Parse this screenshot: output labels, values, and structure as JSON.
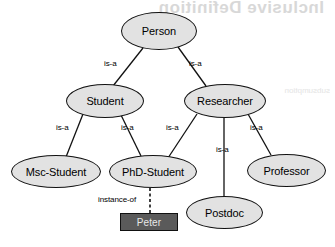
{
  "diagram": {
    "background_color": "#ffffff",
    "node_fill": "#e2e2e2",
    "node_stroke": "#111111",
    "instance_fill": "#5a5a5a",
    "instance_text_color": "#e8e8e8",
    "ghost_text": "Inclusive Definition",
    "ghost_text_secondary": "subsumption",
    "nodes": [
      {
        "id": "person",
        "label": "Person",
        "shape": "ellipse",
        "x": 121,
        "y": 12,
        "w": 76,
        "h": 38
      },
      {
        "id": "student",
        "label": "Student",
        "shape": "ellipse",
        "x": 66,
        "y": 84,
        "w": 78,
        "h": 34
      },
      {
        "id": "researcher",
        "label": "Researcher",
        "shape": "ellipse",
        "x": 184,
        "y": 84,
        "w": 82,
        "h": 34
      },
      {
        "id": "msc",
        "label": "Msc-Student",
        "shape": "ellipse",
        "x": 11,
        "y": 155,
        "w": 90,
        "h": 33
      },
      {
        "id": "phd",
        "label": "PhD-Student",
        "shape": "ellipse",
        "x": 109,
        "y": 155,
        "w": 88,
        "h": 33
      },
      {
        "id": "professor",
        "label": "Professor",
        "shape": "ellipse",
        "x": 247,
        "y": 154,
        "w": 79,
        "h": 33
      },
      {
        "id": "postdoc",
        "label": "Postdoc",
        "shape": "ellipse",
        "x": 186,
        "y": 196,
        "w": 77,
        "h": 33
      },
      {
        "id": "peter",
        "label": "Peter",
        "shape": "box",
        "x": 120,
        "y": 213,
        "w": 58,
        "h": 18
      }
    ],
    "edges": [
      {
        "from": "person",
        "to": "student",
        "label": "is-a",
        "style": "solid",
        "label_x": 104,
        "label_y": 59
      },
      {
        "from": "person",
        "to": "researcher",
        "label": "is-a",
        "style": "solid",
        "label_x": 189,
        "label_y": 59
      },
      {
        "from": "student",
        "to": "msc",
        "label": "is-a",
        "style": "solid",
        "label_x": 56,
        "label_y": 123
      },
      {
        "from": "student",
        "to": "phd",
        "label": "is-a",
        "style": "solid",
        "label_x": 121,
        "label_y": 123
      },
      {
        "from": "researcher",
        "to": "phd",
        "label": "is-a",
        "style": "solid",
        "label_x": 166,
        "label_y": 123
      },
      {
        "from": "researcher",
        "to": "postdoc",
        "label": "is-a",
        "style": "solid",
        "label_x": 216,
        "label_y": 145
      },
      {
        "from": "researcher",
        "to": "professor",
        "label": "is-a",
        "style": "solid",
        "label_x": 250,
        "label_y": 123
      },
      {
        "from": "phd",
        "to": "peter",
        "label": "instance-of",
        "style": "dashed",
        "label_x": 98,
        "label_y": 195
      }
    ],
    "edge_paths": [
      {
        "name": "edge-person-student",
        "x1": 143,
        "y1": 48,
        "x2": 113,
        "y2": 86,
        "style": "solid"
      },
      {
        "name": "edge-person-researcher",
        "x1": 178,
        "y1": 47,
        "x2": 206,
        "y2": 86,
        "style": "solid"
      },
      {
        "name": "edge-student-msc",
        "x1": 83,
        "y1": 114,
        "x2": 66,
        "y2": 157,
        "style": "solid"
      },
      {
        "name": "edge-student-phd",
        "x1": 121,
        "y1": 115,
        "x2": 141,
        "y2": 156,
        "style": "solid"
      },
      {
        "name": "edge-researcher-phd",
        "x1": 197,
        "y1": 114,
        "x2": 168,
        "y2": 158,
        "style": "solid"
      },
      {
        "name": "edge-researcher-postdoc",
        "x1": 224,
        "y1": 118,
        "x2": 224,
        "y2": 197,
        "style": "solid"
      },
      {
        "name": "edge-researcher-prof",
        "x1": 248,
        "y1": 114,
        "x2": 271,
        "y2": 155,
        "style": "solid"
      },
      {
        "name": "edge-phd-peter",
        "x1": 150,
        "y1": 188,
        "x2": 150,
        "y2": 213,
        "style": "dashed"
      }
    ]
  }
}
